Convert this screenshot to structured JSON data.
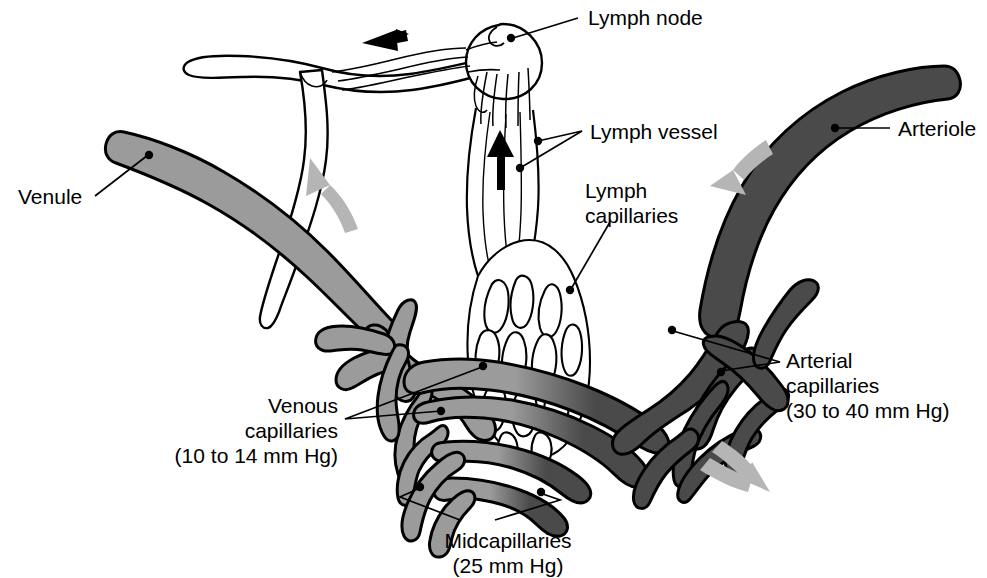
{
  "diagram": {
    "colors": {
      "arterial": "#4a4a4a",
      "venous": "#9b9b9b",
      "midcapillary": "#7a7a7a",
      "lymph": "#ffffff",
      "outline": "#000000",
      "flow_arrow": "#b5b5b5",
      "lymph_arrow": "#000000",
      "background": "#ffffff"
    },
    "labels": [
      {
        "id": "lymph-node",
        "text": "Lymph node",
        "lines": [
          "Lymph node"
        ]
      },
      {
        "id": "arteriole",
        "text": "Arteriole",
        "lines": [
          "Arteriole"
        ]
      },
      {
        "id": "lymph-vessel",
        "text": "Lymph vessel",
        "lines": [
          "Lymph vessel"
        ]
      },
      {
        "id": "lymph-capillaries",
        "text": "Lymph capillaries",
        "lines": [
          "Lymph",
          "capillaries"
        ]
      },
      {
        "id": "venule",
        "text": "Venule",
        "lines": [
          "Venule"
        ]
      },
      {
        "id": "arterial-capillaries",
        "text": "Arterial capillaries (30 to 40 mm Hg)",
        "lines": [
          "Arterial",
          "capillaries",
          "(30 to 40 mm Hg)"
        ]
      },
      {
        "id": "venous-capillaries",
        "text": "Venous capillaries (10 to 14 mm Hg)",
        "lines": [
          "Venous",
          "capillaries",
          "(10 to 14 mm Hg)"
        ]
      },
      {
        "id": "midcapillaries",
        "text": "Midcapillaries (25 mm Hg)",
        "lines": [
          "Midcapillaries",
          "(25 mm Hg)"
        ]
      }
    ],
    "label_text": {
      "lymph_node": "Lymph node",
      "arteriole": "Arteriole",
      "lymph_vessel": "Lymph vessel",
      "lymph_capillaries_l1": "Lymph",
      "lymph_capillaries_l2": "capillaries",
      "venule": "Venule",
      "arterial_capillaries_l1": "Arterial",
      "arterial_capillaries_l2": "capillaries",
      "arterial_capillaries_l3": "(30 to 40 mm Hg)",
      "venous_capillaries_l1": "Venous",
      "venous_capillaries_l2": "capillaries",
      "venous_capillaries_l3": "(10 to 14 mm Hg)",
      "midcapillaries_l1": "Midcapillaries",
      "midcapillaries_l2": "(25 mm Hg)"
    },
    "pressures": [
      {
        "region": "Arterial capillaries",
        "value": "30 to 40 mm Hg"
      },
      {
        "region": "Midcapillaries",
        "value": "25 mm Hg"
      },
      {
        "region": "Venous capillaries",
        "value": "10 to 14 mm Hg"
      }
    ],
    "flow_arrows": [
      {
        "id": "venule-flow",
        "direction": "up-left",
        "kind": "blood-flow"
      },
      {
        "id": "arteriole-flow",
        "direction": "down-left",
        "kind": "blood-flow"
      },
      {
        "id": "capillary-flow",
        "direction": "down-right",
        "kind": "blood-flow"
      },
      {
        "id": "lymph-flow-up",
        "direction": "up",
        "kind": "lymph-flow"
      },
      {
        "id": "lymph-flow-left",
        "direction": "left",
        "kind": "lymph-flow"
      }
    ]
  }
}
